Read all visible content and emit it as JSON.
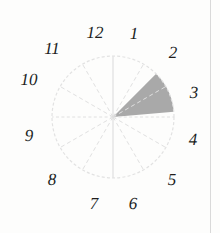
{
  "figure": {
    "type": "clock-face-sector-diagram",
    "background_color": "#fdfdfc"
  },
  "clock": {
    "center": {
      "x": 113,
      "y": 117
    },
    "radius": 61,
    "rim_color": "#e2e2e2",
    "spoke_color": "#e0e0e0",
    "hour_hand_spoke_color": "#dcdcdc",
    "spoke_count": 12,
    "numerals": [
      {
        "label": "1",
        "hour": 1,
        "x": 134,
        "y": 33
      },
      {
        "label": "2",
        "hour": 2,
        "x": 173,
        "y": 52
      },
      {
        "label": "3",
        "hour": 3,
        "x": 194,
        "y": 92
      },
      {
        "label": "4",
        "hour": 4,
        "x": 193,
        "y": 139
      },
      {
        "label": "5",
        "hour": 5,
        "x": 172,
        "y": 179
      },
      {
        "label": "6",
        "hour": 6,
        "x": 133,
        "y": 203
      },
      {
        "label": "7",
        "hour": 7,
        "x": 94,
        "y": 203
      },
      {
        "label": "8",
        "hour": 8,
        "x": 52,
        "y": 179
      },
      {
        "label": "9",
        "hour": 9,
        "x": 29,
        "y": 135
      },
      {
        "label": "10",
        "hour": 10,
        "x": 29,
        "y": 79
      },
      {
        "label": "11",
        "hour": 11,
        "x": 52,
        "y": 48
      },
      {
        "label": "12",
        "hour": 12,
        "x": 95,
        "y": 32
      }
    ]
  },
  "sector": {
    "name": "shaded-sector",
    "fill_color": "#a9a9a9",
    "start_hour": 1.5,
    "end_hour": 2.85,
    "start_angle_deg": 45,
    "end_angle_deg": 85,
    "angle_span_deg": 40
  },
  "chart_data": {
    "type": "pie",
    "title": "",
    "categories": [
      "12-1",
      "1-2",
      "2-3",
      "3-4",
      "4-5",
      "5-6",
      "6-7",
      "7-8",
      "8-9",
      "9-10",
      "10-11",
      "11-12"
    ],
    "values": [
      30,
      30,
      30,
      30,
      30,
      30,
      30,
      30,
      30,
      30,
      30,
      30
    ],
    "highlighted_slices": [
      "1-2",
      "2-3"
    ],
    "highlight_start_deg": 45,
    "highlight_end_deg": 85,
    "xlabel": "",
    "ylabel": "",
    "legend": "none",
    "grid": false
  }
}
